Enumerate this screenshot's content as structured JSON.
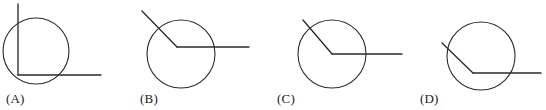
{
  "figure": {
    "type": "geometry-diagram-set",
    "canvas": {
      "width": 546,
      "height": 110
    },
    "stroke_color": "#2b2b2b",
    "background_color": "#ffffff",
    "label_color": "#1a1a1a"
  },
  "panels": [
    {
      "id": "A",
      "label": "(A)",
      "label_x": 6,
      "label_y": 92,
      "origin_x": 0,
      "vertex_note": "vertex on the circle at lower-left; rays point up and right",
      "circle": {
        "cx": 36,
        "cy": 51,
        "r": 33
      },
      "vertex": {
        "x": 18,
        "y": 75
      },
      "rays": [
        {
          "name": "ray-up",
          "x1": 18,
          "y1": 75,
          "x2": 18,
          "y2": 4
        },
        {
          "name": "ray-right",
          "x1": 18,
          "y1": 75,
          "x2": 101,
          "y2": 75
        }
      ]
    },
    {
      "id": "B",
      "label": "(B)",
      "label_x": 140,
      "label_y": 92,
      "origin_x": 0,
      "vertex_note": "vertex inside the circle above center; one ray exits upper-left, one exits right",
      "circle": {
        "cx": 181,
        "cy": 54,
        "r": 34
      },
      "vertex": {
        "x": 177,
        "y": 47
      },
      "rays": [
        {
          "name": "ray-upper-left",
          "x1": 177,
          "y1": 47,
          "x2": 142,
          "y2": 11
        },
        {
          "name": "ray-right",
          "x1": 177,
          "y1": 47,
          "x2": 249,
          "y2": 47
        }
      ]
    },
    {
      "id": "C",
      "label": "(C)",
      "label_x": 277,
      "label_y": 92,
      "origin_x": 0,
      "vertex_note": "vertex at the center of the circle; one ray exits upper-left, one exits right",
      "circle": {
        "cx": 332,
        "cy": 54,
        "r": 34
      },
      "vertex": {
        "x": 332,
        "y": 54
      },
      "rays": [
        {
          "name": "ray-upper-left",
          "x1": 332,
          "y1": 54,
          "x2": 303,
          "y2": 20
        },
        {
          "name": "ray-right",
          "x1": 332,
          "y1": 54,
          "x2": 402,
          "y2": 54
        }
      ]
    },
    {
      "id": "D",
      "label": "(D)",
      "label_x": 420,
      "label_y": 92,
      "origin_x": 0,
      "vertex_note": "vertex inside the circle below center; one ray exits upper-left, one exits right",
      "circle": {
        "cx": 481,
        "cy": 56,
        "r": 34
      },
      "vertex": {
        "x": 473,
        "y": 73
      },
      "rays": [
        {
          "name": "ray-upper-left",
          "x1": 473,
          "y1": 73,
          "x2": 442,
          "y2": 43
        },
        {
          "name": "ray-right",
          "x1": 473,
          "y1": 73,
          "x2": 541,
          "y2": 73
        }
      ]
    }
  ]
}
